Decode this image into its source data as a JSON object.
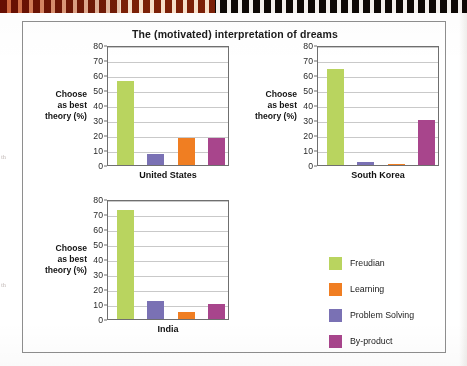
{
  "figure": {
    "title": "The (motivated) interpretation of dreams",
    "axis_title_line1": "Choose",
    "axis_title_line2": "as best",
    "axis_title_line3": "theory (%)"
  },
  "legend": {
    "items": [
      {
        "label": "Freudian",
        "color": "#b9d45f"
      },
      {
        "label": "Learning",
        "color": "#f07e22"
      },
      {
        "label": "Problem Solving",
        "color": "#7a71b4"
      },
      {
        "label": "By-product",
        "color": "#a8458c"
      }
    ]
  },
  "chart_data": {
    "type": "bar",
    "title": "The (motivated) interpretation of dreams",
    "xlabel": "",
    "ylabel": "Choose as best theory (%)",
    "ylim": [
      0,
      80
    ],
    "yticks": [
      0,
      10,
      20,
      30,
      40,
      50,
      60,
      70,
      80
    ],
    "grid": true,
    "legend_position": "right-bottom",
    "bar_order": [
      "Freudian",
      "Problem Solving",
      "Learning",
      "By-product"
    ],
    "panels": [
      {
        "name": "United States",
        "categories": [
          "Freudian",
          "Problem Solving",
          "Learning",
          "By-product"
        ],
        "values": [
          56,
          7.5,
          18,
          18
        ],
        "colors": [
          "#b9d45f",
          "#7a71b4",
          "#f07e22",
          "#a8458c"
        ]
      },
      {
        "name": "South Korea",
        "categories": [
          "Freudian",
          "Problem Solving",
          "Learning",
          "By-product"
        ],
        "values": [
          64,
          2,
          0.8,
          30
        ],
        "colors": [
          "#b9d45f",
          "#7a71b4",
          "#f07e22",
          "#a8458c"
        ]
      },
      {
        "name": "India",
        "categories": [
          "Freudian",
          "Problem Solving",
          "Learning",
          "By-product"
        ],
        "values": [
          73,
          12,
          5,
          10
        ],
        "colors": [
          "#b9d45f",
          "#7a71b4",
          "#f07e22",
          "#a8458c"
        ]
      }
    ]
  },
  "margin_ghost_text": [
    "th",
    "th"
  ]
}
